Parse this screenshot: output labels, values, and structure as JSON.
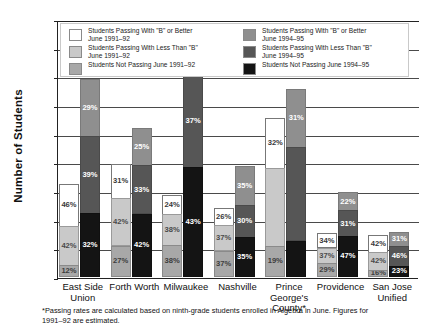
{
  "chart_data": {
    "type": "bar",
    "title": "",
    "xlabel": "",
    "ylabel": "Number of Students",
    "ylim": [
      0,
      4500
    ],
    "ytick_labels": [
      "0",
      "500",
      "1000",
      "1500",
      "2000",
      "2500",
      "3000",
      "3500",
      "4000",
      "4500"
    ],
    "ytick_values": [
      0,
      500,
      1000,
      1500,
      2000,
      2500,
      3000,
      3500,
      4000,
      4500
    ],
    "grid": true,
    "legend_position": "top-inside",
    "stacked": true,
    "categories": [
      "East Side Union",
      "Forth Worth",
      "Milwaukee",
      "Nashville",
      "Prince George's County*",
      "Providence",
      "San Jose Unified"
    ],
    "series": [
      {
        "name": "Students Passing With \"B\" or Better June 1991–92",
        "group": "1991-92",
        "color": "#ffffff",
        "percent_labels": [
          "46%",
          "31%",
          "24%",
          "26%",
          "32%",
          "34%",
          "42%"
        ],
        "values": [
          759,
          620,
          348,
          320,
          896,
          269,
          315
        ]
      },
      {
        "name": "Students Passing With Less Than \"B\" June 1991–92",
        "group": "1991-92",
        "color": "#c9c9c9",
        "percent_labels": [
          "42%",
          "42%",
          "38%",
          "37%",
          "",
          "37%",
          "42%"
        ],
        "values": [
          693,
          840,
          551,
          455,
          1372,
          292,
          315
        ]
      },
      {
        "name": "Students Not Passing June 1991–92",
        "group": "1991-92",
        "color": "#a8a8a8",
        "percent_labels": [
          "12%",
          "27%",
          "38%",
          "37%",
          "19%",
          "29%",
          "16%"
        ],
        "values": [
          198,
          540,
          551,
          455,
          532,
          229,
          120
        ]
      },
      {
        "name": "Students Passing With \"B\" or Better June 1994–95",
        "group": "1994-95",
        "color": "#8f8f8f",
        "percent_labels": [
          "29%",
          "25%",
          "",
          "35%",
          "31%",
          "22%",
          "31%"
        ],
        "values": [
          1006,
          655,
          886,
          683,
          1023,
          330,
          248
        ]
      },
      {
        "name": "Students Passing With Less Than \"B\" June 1994–95",
        "group": "1994-95",
        "color": "#565656",
        "percent_labels": [
          "39%",
          "33%",
          "37%",
          "30%",
          "",
          "31%",
          "46%"
        ],
        "values": [
          1353,
          865,
          1639,
          585,
          1650,
          465,
          368
        ]
      },
      {
        "name": "Students Not Passing June 1994–95",
        "group": "1994-95",
        "color": "#141414",
        "percent_labels": [
          "32%",
          "42%",
          "43%",
          "35%",
          "",
          "47%",
          "23%"
        ],
        "values": [
          1110,
          1100,
          1905,
          683,
          627,
          705,
          184
        ]
      }
    ],
    "group_totals_1991_92": [
      1650,
      2000,
      1450,
      1230,
      2800,
      790,
      750
    ],
    "group_totals_1994_95": [
      3470,
      2620,
      4430,
      1950,
      3300,
      1500,
      800
    ],
    "annotations": []
  },
  "legend": {
    "items": [
      {
        "swatch": "sw1",
        "line1": "Students Passing With \"B\" or Better",
        "line2": "June 1991–92"
      },
      {
        "swatch": "sw2",
        "line1": "Students Passing With Less Than \"B\"",
        "line2": "June 1991–92"
      },
      {
        "swatch": "sw3",
        "line1": "Students Not Passing June 1991–92",
        "line2": ""
      },
      {
        "swatch": "sw4",
        "line1": "Students Passing With \"B\" or Better",
        "line2": "June 1994–95"
      },
      {
        "swatch": "sw5",
        "line1": "Students Passing With Less Than \"B\"",
        "line2": "June 1994–95"
      },
      {
        "swatch": "sw6",
        "line1": "Students Not Passing June 1994–95",
        "line2": ""
      }
    ]
  },
  "footnote": {
    "line1": "*Passing rates are calculated based on ninth-grade students enrolled in Algebra in June. Figures for",
    "line2": "1991–92 are estimated."
  }
}
